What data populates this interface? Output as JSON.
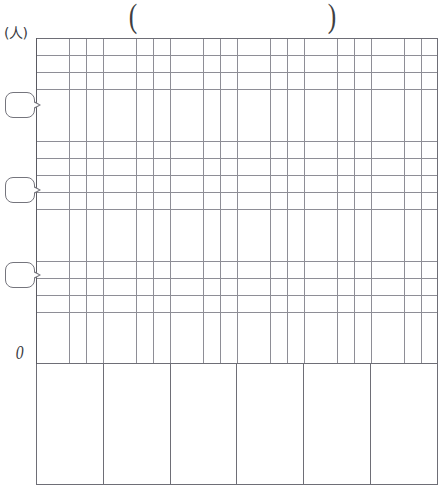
{
  "worksheet": {
    "kind": "blank-bar-graph-template",
    "title": {
      "open_paren": "(",
      "close_paren": ")",
      "text": ""
    },
    "y_axis": {
      "unit_label": "(人)",
      "origin_label": "0",
      "value_blanks": [
        {
          "name": "y-value-blank-top",
          "value": ""
        },
        {
          "name": "y-value-blank-middle",
          "value": ""
        },
        {
          "name": "y-value-blank-lower",
          "value": ""
        }
      ],
      "gridlines": 19
    },
    "x_axis": {
      "gridlines": 24,
      "category_labels": [
        "",
        "",
        "",
        "",
        "",
        ""
      ]
    },
    "chart_data": {
      "type": "bar",
      "title": "",
      "xlabel": "",
      "ylabel": "(人)",
      "categories": [
        "",
        "",
        "",
        "",
        "",
        ""
      ],
      "values": [
        0,
        0,
        0,
        0,
        0,
        0
      ],
      "ylim": [
        0,
        0
      ],
      "yticks": [
        "0",
        "",
        "",
        ""
      ],
      "grid": true,
      "legend": "none",
      "note": "Blank worksheet template — no data plotted; all labels and bars left empty for the student to fill in."
    },
    "colors": {
      "grid_line": "#8e8e96",
      "axis_line": "#5a5a62",
      "table_border": "#6e6e76",
      "ink": "#3a3a3e",
      "paper": "#ffffff"
    }
  }
}
